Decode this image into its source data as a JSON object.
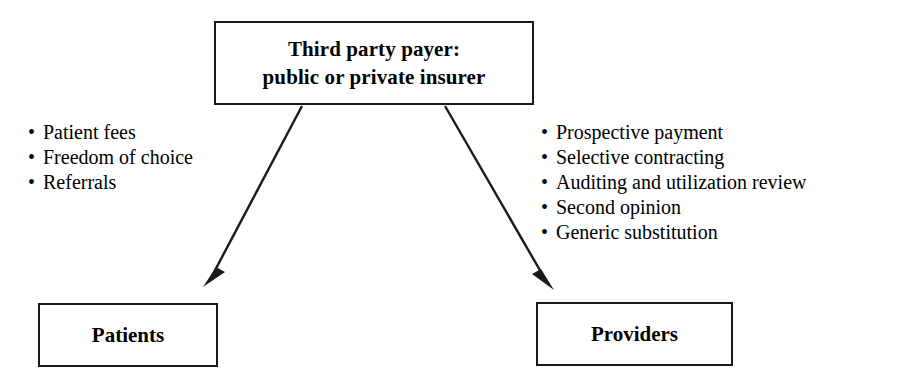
{
  "diagram": {
    "title_node": {
      "label": "Third party payer:\npublic or private insurer"
    },
    "left_node": {
      "label": "Patients"
    },
    "right_node": {
      "label": "Providers"
    },
    "left_list": {
      "bullet_glyph": "•",
      "items": [
        {
          "label": "Patient fees"
        },
        {
          "label": "Freedom of choice"
        },
        {
          "label": "Referrals"
        }
      ]
    },
    "right_list": {
      "bullet_glyph": "•",
      "items": [
        {
          "label": "Prospective payment"
        },
        {
          "label": "Selective contracting"
        },
        {
          "label": "Auditing and utilization review"
        },
        {
          "label": "Second opinion"
        },
        {
          "label": "Generic substitution"
        }
      ]
    },
    "connectors": [
      {
        "name": "payer-to-patients-arrow",
        "from": "title_node",
        "to": "left_node"
      },
      {
        "name": "payer-to-providers-arrow",
        "from": "title_node",
        "to": "right_node"
      }
    ],
    "colors": {
      "stroke": "#1a1a1a",
      "background": "#ffffff",
      "text": "#000000"
    }
  }
}
